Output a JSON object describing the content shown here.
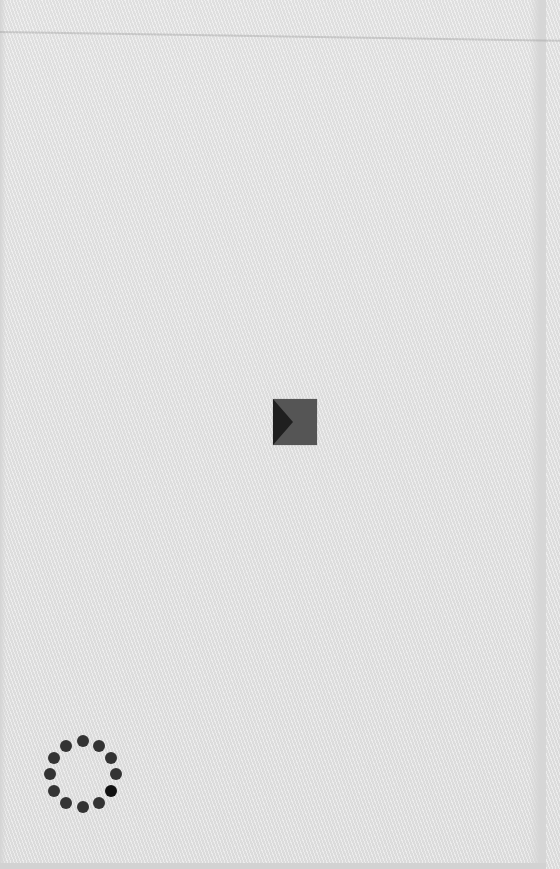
{
  "screen": {
    "type": "loading-splash",
    "background_color": "#e3e3e3"
  },
  "logo": {
    "icon": "play-triangle-square-icon",
    "square_color": "#555555",
    "triangle_color": "#1f1f1f"
  },
  "spinner": {
    "icon": "loading-spinner-icon",
    "dot_count": 12,
    "dot_color": "#333333",
    "active_dot_color": "#111111",
    "active_dot_index": 3
  }
}
